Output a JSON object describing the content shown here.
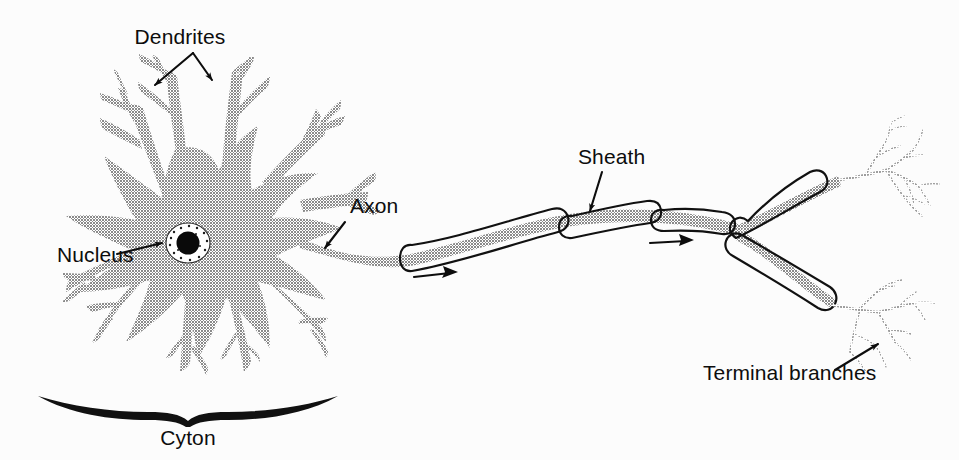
{
  "figure": {
    "width": 959,
    "height": 460,
    "background_color": "#fcfcfc"
  },
  "colors": {
    "cell_gray": "#9a9a9a",
    "outline_black": "#111111",
    "label_black": "#0d0d0d",
    "nucleus_black": "#0a0a0a",
    "terminal_gray": "#a8a8a8",
    "background": "#fcfcfc"
  },
  "labels": {
    "dendrites": "Dendrites",
    "nucleus": "Nucleus",
    "axon": "Axon",
    "sheath": "Sheath",
    "terminal_branches": "Terminal branches",
    "cyton": "Cyton"
  },
  "parts": [
    {
      "id": "dendrites",
      "label": "Dendrites",
      "description": "Branching gray projections radiating from the cell body",
      "label_x": 180,
      "label_y": 44,
      "arrow_count": 2
    },
    {
      "id": "nucleus",
      "label": "Nucleus",
      "description": "Dark round nucleus with stippled halo inside the cyton",
      "label_x": 60,
      "label_y": 260,
      "arrow_count": 1
    },
    {
      "id": "axon",
      "label": "Axon",
      "description": "Long gray fiber extending right from the cell body",
      "label_x": 350,
      "label_y": 210,
      "arrow_count": 1
    },
    {
      "id": "sheath",
      "label": "Sheath",
      "description": "Myelin sheath capsules enclosing the axon between nodes",
      "label_x": 578,
      "label_y": 162,
      "arrow_count": 1
    },
    {
      "id": "terminal_branches",
      "label": "Terminal branches",
      "description": "Fine branching arbors at the ends of the axon",
      "label_x": 703,
      "label_y": 377,
      "arrow_count": 1
    },
    {
      "id": "cyton",
      "label": "Cyton",
      "description": "Cell body, marked by a brace beneath the soma",
      "label_x": 183,
      "label_y": 437,
      "arrow_count": 0
    }
  ],
  "signal_arrows": [
    {
      "id": "signal-arrow-1",
      "x": 414,
      "y": 277,
      "direction": "right"
    },
    {
      "id": "signal-arrow-2",
      "x": 650,
      "y": 243,
      "direction": "right"
    }
  ],
  "sheath_segments": [
    {
      "id": "sheath-segment-1",
      "order": 1
    },
    {
      "id": "sheath-segment-2",
      "order": 2
    },
    {
      "id": "sheath-segment-3",
      "order": 3
    },
    {
      "id": "sheath-segment-4",
      "order": 4
    },
    {
      "id": "sheath-segment-5-upper-branch",
      "order": 5
    },
    {
      "id": "sheath-segment-6-lower-branch",
      "order": 6
    }
  ],
  "terminal_arbors": [
    {
      "id": "terminal-arbor-upper",
      "x": 860,
      "y": 175
    },
    {
      "id": "terminal-arbor-lower",
      "x": 855,
      "y": 300
    }
  ]
}
